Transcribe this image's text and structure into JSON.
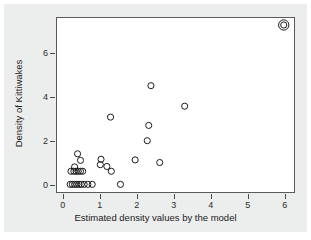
{
  "chart_data": {
    "type": "scatter",
    "title": "",
    "xlabel": "Estimated density values by the model",
    "ylabel": "Density of Kittiwakes",
    "xlim": [
      -0.18,
      6.28
    ],
    "ylim": [
      -0.35,
      7.62
    ],
    "xticks": [
      0,
      1,
      2,
      3,
      4,
      5,
      6
    ],
    "xtick_labels": [
      "0",
      "1",
      "2",
      "3",
      "4",
      "5",
      "6"
    ],
    "yticks": [
      0,
      2,
      4,
      6
    ],
    "ytick_labels": [
      "0",
      "2",
      "4",
      "6"
    ],
    "grid": false,
    "legend": null,
    "marker": "open-circle",
    "marker_color": "#1a1a1a",
    "background_color": "#eceded",
    "plot_background_color": "#ffffff",
    "frame_color": "#5a5a5a",
    "points": [
      {
        "x": 0.18,
        "y": 0.0
      },
      {
        "x": 0.24,
        "y": 0.0
      },
      {
        "x": 0.3,
        "y": 0.0
      },
      {
        "x": 0.36,
        "y": 0.0
      },
      {
        "x": 0.42,
        "y": 0.0
      },
      {
        "x": 0.48,
        "y": 0.0
      },
      {
        "x": 0.56,
        "y": 0.0
      },
      {
        "x": 0.66,
        "y": 0.0
      },
      {
        "x": 0.78,
        "y": 0.0
      },
      {
        "x": 1.55,
        "y": 0.0
      },
      {
        "x": 0.2,
        "y": 0.6
      },
      {
        "x": 0.28,
        "y": 0.6
      },
      {
        "x": 0.34,
        "y": 0.6
      },
      {
        "x": 0.4,
        "y": 0.6
      },
      {
        "x": 0.46,
        "y": 0.6
      },
      {
        "x": 0.52,
        "y": 0.6
      },
      {
        "x": 1.3,
        "y": 0.6
      },
      {
        "x": 0.3,
        "y": 0.8
      },
      {
        "x": 1.18,
        "y": 0.82
      },
      {
        "x": 1.0,
        "y": 0.9
      },
      {
        "x": 0.46,
        "y": 1.1
      },
      {
        "x": 1.02,
        "y": 1.15
      },
      {
        "x": 1.95,
        "y": 1.12
      },
      {
        "x": 2.62,
        "y": 1.0
      },
      {
        "x": 0.38,
        "y": 1.4
      },
      {
        "x": 2.28,
        "y": 2.0
      },
      {
        "x": 2.32,
        "y": 2.7
      },
      {
        "x": 1.28,
        "y": 3.08
      },
      {
        "x": 3.3,
        "y": 3.58
      },
      {
        "x": 2.38,
        "y": 4.52
      },
      {
        "x": 6.0,
        "y": 7.3
      }
    ],
    "highlighted_point": {
      "x": 6.0,
      "y": 7.3,
      "style": "double-circle"
    }
  }
}
